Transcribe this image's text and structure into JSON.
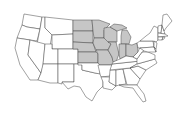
{
  "map": {
    "title": "United States map with Midwest region highlighted",
    "highlight_color": "#c6c6c6",
    "base_color": "#ffffff",
    "border_color": "#444444",
    "highlighted_region": "Midwest",
    "highlighted_states": [
      "North Dakota",
      "South Dakota",
      "Nebraska",
      "Kansas",
      "Minnesota",
      "Iowa",
      "Missouri",
      "Wisconsin",
      "Illinois",
      "Michigan",
      "Indiana",
      "Ohio"
    ]
  }
}
